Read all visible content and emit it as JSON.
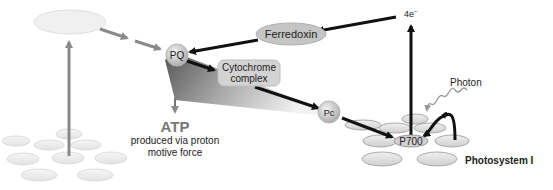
{
  "diagram": {
    "nodes": {
      "pq": "PQ",
      "ferredoxin": "Ferredoxin",
      "cytochrome_line1": "Cytochrome",
      "cytochrome_line2": "complex",
      "pc": "Pc",
      "p700": "P700",
      "electrons": "4e",
      "electrons_sup": "−"
    },
    "labels": {
      "atp": "ATP",
      "atp_desc_line1": "produced via proton",
      "atp_desc_line2": "motive force",
      "photon": "Photon",
      "photosystem": "Photosystem I"
    },
    "colors": {
      "arrow_black": "#111111",
      "arrow_faded": "#8a8a8a",
      "node_fill": "#c8c8c8",
      "disk_fill": "#e4e4e4",
      "faded_disk_fill": "#eeeeee"
    }
  }
}
